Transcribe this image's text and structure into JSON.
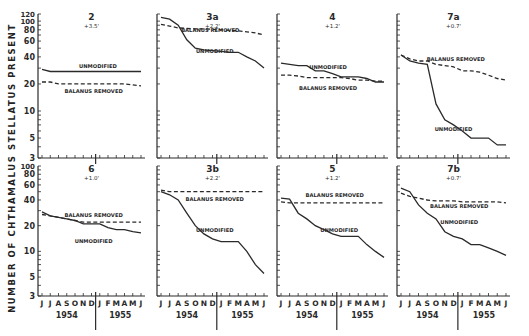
{
  "figure": {
    "ylabel": "NUMBER OF CHTHAMALUS STELLATUS PRESENT",
    "xaxis_months": [
      "J",
      "J",
      "A",
      "S",
      "O",
      "N",
      "D",
      "J",
      "F",
      "M",
      "A",
      "M",
      "J"
    ],
    "years": [
      "1954",
      "1955"
    ],
    "yticks_top": [
      120,
      100,
      80,
      60,
      40,
      20,
      10,
      5,
      3
    ],
    "yticks_bottom": [
      100,
      80,
      60,
      40,
      20,
      10,
      5,
      3
    ]
  },
  "chart_data": [
    {
      "type": "line",
      "title": "2",
      "subtitle": "+3.5'",
      "ylim": [
        3,
        120
      ],
      "yscale": "log",
      "x": [
        "J",
        "J",
        "A",
        "S",
        "O",
        "N",
        "D",
        "J",
        "F",
        "M",
        "A",
        "M",
        "J"
      ],
      "series": [
        {
          "name": "UNMODIFIED",
          "style": "solid",
          "values": [
            29,
            27.5,
            27.5,
            27.5,
            27.5,
            27.5,
            27.5,
            27.5,
            27.5,
            27.5,
            27.5,
            27.5,
            27.5
          ]
        },
        {
          "name": "BALANUS REMOVED",
          "style": "dashed",
          "values": [
            21,
            21,
            20,
            20,
            20,
            20,
            20,
            20,
            20,
            20,
            20,
            19.5,
            19
          ]
        }
      ]
    },
    {
      "type": "line",
      "title": "3a",
      "subtitle": "+2.2'",
      "ylim": [
        3,
        120
      ],
      "yscale": "log",
      "x": [
        "J",
        "J",
        "A",
        "S",
        "O",
        "N",
        "D",
        "J",
        "F",
        "M",
        "A",
        "M",
        "J"
      ],
      "series": [
        {
          "name": "UNMODIFIED",
          "style": "solid",
          "values": [
            110,
            105,
            90,
            62,
            50,
            48,
            47,
            46,
            45,
            45,
            40,
            36,
            30
          ]
        },
        {
          "name": "BALANUS REMOVED",
          "style": "dashed",
          "values": [
            92,
            88,
            84,
            83,
            82,
            82,
            81,
            80,
            79,
            78,
            76,
            74,
            70
          ]
        }
      ]
    },
    {
      "type": "line",
      "title": "4",
      "subtitle": "+1.2'",
      "ylim": [
        3,
        120
      ],
      "yscale": "log",
      "x": [
        "J",
        "J",
        "A",
        "S",
        "O",
        "N",
        "D",
        "J",
        "F",
        "M",
        "A",
        "M",
        "J"
      ],
      "series": [
        {
          "name": "UNMODIFIED",
          "style": "solid",
          "values": [
            34,
            33,
            32,
            32,
            28,
            28,
            26,
            24,
            24,
            24,
            23,
            21,
            21
          ]
        },
        {
          "name": "BALANUS REMOVED",
          "style": "dashed",
          "values": [
            25,
            25,
            24.5,
            23.5,
            23.5,
            23.5,
            23.5,
            23.5,
            23,
            22,
            22,
            21.5,
            21.5
          ]
        }
      ]
    },
    {
      "type": "line",
      "title": "7a",
      "subtitle": "+0.7'",
      "ylim": [
        3,
        120
      ],
      "yscale": "log",
      "x": [
        "J",
        "J",
        "A",
        "S",
        "O",
        "N",
        "D",
        "J",
        "F",
        "M",
        "A",
        "M",
        "J"
      ],
      "series": [
        {
          "name": "UNMODIFIED",
          "style": "solid",
          "values": [
            42,
            36,
            34,
            33,
            12,
            8,
            7,
            6,
            5,
            5,
            5,
            4.2,
            4.2
          ]
        },
        {
          "name": "BALANUS REMOVED",
          "style": "dashed",
          "values": [
            42,
            38,
            36,
            36,
            33,
            32,
            31,
            28,
            28,
            27,
            25,
            23,
            22
          ]
        }
      ]
    },
    {
      "type": "line",
      "title": "6",
      "subtitle": "+1.0'",
      "ylim": [
        3,
        100
      ],
      "yscale": "log",
      "x": [
        "J",
        "J",
        "A",
        "S",
        "O",
        "N",
        "D",
        "J",
        "F",
        "M",
        "A",
        "M",
        "J"
      ],
      "series": [
        {
          "name": "UNMODIFIED",
          "style": "solid",
          "values": [
            29,
            26,
            25,
            24,
            23,
            21,
            21,
            21,
            19,
            18,
            18,
            17,
            16.5
          ]
        },
        {
          "name": "BALANUS REMOVED",
          "style": "dashed",
          "values": [
            27,
            26,
            25,
            24,
            23,
            22,
            22,
            22,
            22,
            22,
            22,
            22,
            22
          ]
        }
      ]
    },
    {
      "type": "line",
      "title": "3b",
      "subtitle": "+2.2'",
      "ylim": [
        3,
        100
      ],
      "yscale": "log",
      "x": [
        "J",
        "J",
        "A",
        "S",
        "O",
        "N",
        "D",
        "J",
        "F",
        "M",
        "A",
        "M",
        "J"
      ],
      "series": [
        {
          "name": "UNMODIFIED",
          "style": "solid",
          "values": [
            50,
            46,
            40,
            28,
            20,
            16,
            14,
            13,
            13,
            13,
            10,
            7,
            5.5
          ]
        },
        {
          "name": "BALANUS REMOVED",
          "style": "dashed",
          "values": [
            52,
            50,
            50,
            50,
            50,
            50,
            50,
            50,
            50,
            50,
            50,
            50,
            50
          ]
        }
      ]
    },
    {
      "type": "line",
      "title": "5",
      "subtitle": "+1.2'",
      "ylim": [
        3,
        100
      ],
      "yscale": "log",
      "x": [
        "J",
        "J",
        "A",
        "S",
        "O",
        "N",
        "D",
        "J",
        "F",
        "M",
        "A",
        "M",
        "J"
      ],
      "series": [
        {
          "name": "UNMODIFIED",
          "style": "solid",
          "values": [
            42,
            41,
            28,
            24,
            20,
            18,
            16,
            15,
            15,
            15,
            12,
            10,
            8.5
          ]
        },
        {
          "name": "BALANUS REMOVED",
          "style": "dashed",
          "values": [
            38,
            37,
            37,
            37,
            37,
            37,
            37,
            37,
            37,
            37,
            37,
            37,
            37
          ]
        }
      ]
    },
    {
      "type": "line",
      "title": "7b",
      "subtitle": "+0.7'",
      "ylim": [
        3,
        100
      ],
      "yscale": "log",
      "x": [
        "J",
        "J",
        "A",
        "S",
        "O",
        "N",
        "D",
        "J",
        "F",
        "M",
        "A",
        "M",
        "J"
      ],
      "series": [
        {
          "name": "UNMODIFIED",
          "style": "solid",
          "values": [
            55,
            50,
            35,
            28,
            24,
            17,
            15,
            14,
            12,
            12,
            11,
            10,
            9
          ]
        },
        {
          "name": "BALANUS REMOVED",
          "style": "dashed",
          "values": [
            48,
            44,
            42,
            40,
            39,
            39,
            39,
            38,
            38,
            38,
            38,
            38,
            37
          ]
        }
      ]
    }
  ],
  "labels": {
    "unmodified": "UNMODIFIED",
    "balanus_removed": "BALANUS REMOVED"
  },
  "label_positions": [
    {
      "unmod": [
        56,
        30
      ],
      "bal": [
        52,
        16
      ]
    },
    {
      "unmod": [
        52,
        44
      ],
      "bal": [
        48,
        76
      ]
    },
    {
      "unmod": [
        46,
        29
      ],
      "bal": [
        46,
        17
      ]
    },
    {
      "unmod": [
        50,
        6
      ],
      "bal": [
        52,
        36
      ]
    },
    {
      "unmod": [
        52,
        12.5
      ],
      "bal": [
        52,
        25.5
      ]
    },
    {
      "unmod": [
        52,
        17
      ],
      "bal": [
        52,
        39
      ]
    },
    {
      "unmod": [
        56,
        17
      ],
      "bal": [
        52,
        43
      ]
    },
    {
      "unmod": [
        55,
        21
      ],
      "bal": [
        55,
        32
      ]
    }
  ]
}
